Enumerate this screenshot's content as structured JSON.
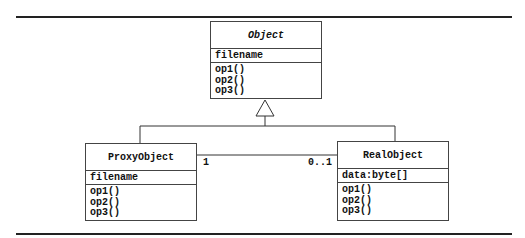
{
  "diagram": {
    "type": "UML class diagram (Proxy pattern)",
    "classes": [
      {
        "name": "Object",
        "abstract": true,
        "attributes": [
          "filename"
        ],
        "operations": [
          "op1()",
          "op2()",
          "op3()"
        ]
      },
      {
        "name": "ProxyObject",
        "abstract": false,
        "attributes": [
          "filename"
        ],
        "operations": [
          "op1()",
          "op2()",
          "op3()"
        ]
      },
      {
        "name": "RealObject",
        "abstract": false,
        "attributes": [
          "data:byte[]"
        ],
        "operations": [
          "op1()",
          "op2()",
          "op3()"
        ]
      }
    ],
    "relationships": [
      {
        "type": "generalization",
        "from": "ProxyObject",
        "to": "Object"
      },
      {
        "type": "generalization",
        "from": "RealObject",
        "to": "Object"
      },
      {
        "type": "association",
        "from": "ProxyObject",
        "to": "RealObject",
        "from_multiplicity": "1",
        "to_multiplicity": "0..1"
      }
    ]
  }
}
